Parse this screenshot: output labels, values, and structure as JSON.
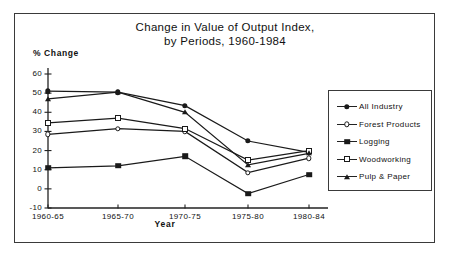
{
  "chart_data": {
    "type": "line",
    "title": "Change in Value of Output Index, by Periods, 1960-1984",
    "title_lines": [
      "Change in Value of Output Index,",
      "by Periods, 1960-1984"
    ],
    "xlabel": "Year",
    "ylabel": "% Change",
    "categories": [
      "1960-65",
      "1965-70",
      "1970-75",
      "1975-80",
      "1980-84"
    ],
    "ylim": [
      -10,
      60
    ],
    "yticks": [
      60,
      50,
      40,
      30,
      20,
      10,
      0,
      "-10"
    ],
    "grid": false,
    "legend_position": "right",
    "series": [
      {
        "name": "All  Industry",
        "marker": "filled-circle",
        "values": [
          51,
          50.5,
          43.5,
          25,
          19
        ]
      },
      {
        "name": "Forest Products",
        "marker": "open-circle",
        "values": [
          28.5,
          31.5,
          30,
          8.5,
          16
        ]
      },
      {
        "name": "Logging",
        "marker": "filled-square",
        "values": [
          11,
          12,
          17,
          -2.5,
          7.5
        ]
      },
      {
        "name": "Woodworking",
        "marker": "open-square",
        "values": [
          34.5,
          37,
          31.5,
          15,
          20
        ]
      },
      {
        "name": "Pulp & Paper",
        "marker": "filled-triangle",
        "values": [
          47,
          50.5,
          40,
          12.5,
          18.5
        ]
      }
    ]
  }
}
